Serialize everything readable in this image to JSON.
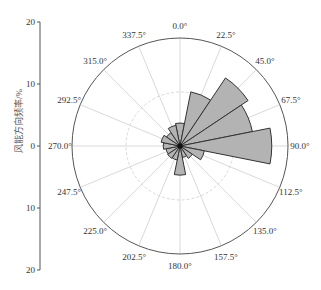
{
  "chart_data": {
    "type": "rose",
    "title": "",
    "ylabel": "风能方向频率/%",
    "y_axis_ticks": [
      "20",
      "10",
      "0",
      "10",
      "20"
    ],
    "radial_max": 20,
    "radial_gridlines": [
      10,
      20
    ],
    "grid": true,
    "angle_labels": [
      "0.0°",
      "22.5°",
      "45.0°",
      "67.5°",
      "90.0°",
      "112.5°",
      "135.0°",
      "157.5°",
      "180.0°",
      "202.5°",
      "225.0°",
      "247.5°",
      "270.0°",
      "292.5°",
      "315.0°",
      "337.5°"
    ],
    "directions": [
      0,
      22.5,
      45,
      67.5,
      90,
      112.5,
      135,
      157.5,
      180,
      202.5,
      225,
      247.5,
      270,
      292.5,
      315,
      337.5
    ],
    "values": [
      3.7,
      8.9,
      13.2,
      11.9,
      14.8,
      4.0,
      2.4,
      1.9,
      4.7,
      2.3,
      2.4,
      2.3,
      2.7,
      3.1,
      2.6,
      3.4
    ],
    "sector_width_deg": 22.5,
    "colors": {
      "fill": "#b3b3b3",
      "edge": "#333333",
      "grid": "#d9d9d9",
      "outer": "#555555"
    }
  },
  "axis": {
    "ylabel": "风能方向频率/%"
  }
}
